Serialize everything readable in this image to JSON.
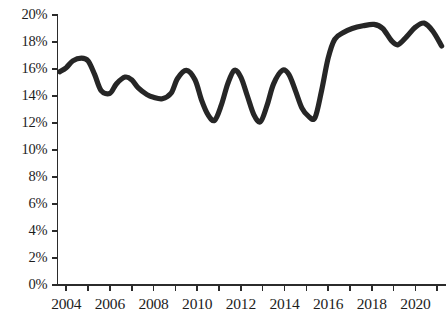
{
  "chart_data": {
    "type": "line",
    "title": "",
    "subtitle": "",
    "xlabel": "",
    "ylabel": "",
    "xlim": [
      2003.6,
      2021.4
    ],
    "ylim": [
      0,
      20
    ],
    "grid": false,
    "legend": false,
    "legend_position": "none",
    "line_color": "#262626",
    "y_tick_labels": [
      "20%",
      "18%",
      "16%",
      "14%",
      "12%",
      "10%",
      "8%",
      "6%",
      "4%",
      "2%",
      "0%"
    ],
    "y_tick_values": [
      20,
      18,
      16,
      14,
      12,
      10,
      8,
      6,
      4,
      2,
      0
    ],
    "y_tick_step": 2,
    "x_tick_labels": [
      "2004",
      "2006",
      "2008",
      "2010",
      "2012",
      "2014",
      "2016",
      "2018",
      "2020"
    ],
    "x_tick_values": [
      2004,
      2006,
      2008,
      2010,
      2012,
      2014,
      2016,
      2018,
      2020
    ],
    "x_minor_tick_values": [
      2004,
      2005,
      2006,
      2007,
      2008,
      2009,
      2010,
      2011,
      2012,
      2013,
      2014,
      2015,
      2016,
      2017,
      2018,
      2019,
      2020,
      2021
    ],
    "series": [
      {
        "name": "series-1",
        "x": [
          2003.7,
          2004.0,
          2004.3,
          2004.7,
          2005.0,
          2005.3,
          2005.6,
          2006.0,
          2006.3,
          2006.7,
          2007.0,
          2007.3,
          2007.7,
          2008.0,
          2008.4,
          2008.8,
          2009.1,
          2009.5,
          2009.9,
          2010.2,
          2010.5,
          2010.8,
          2011.1,
          2011.4,
          2011.7,
          2012.0,
          2012.3,
          2012.6,
          2012.9,
          2013.2,
          2013.5,
          2013.9,
          2014.2,
          2014.5,
          2014.8,
          2015.1,
          2015.4,
          2015.7,
          2016.0,
          2016.3,
          2016.7,
          2017.1,
          2017.6,
          2018.1,
          2018.5,
          2018.9,
          2019.2,
          2019.6,
          2020.0,
          2020.4,
          2020.8,
          2021.2
        ],
        "y": [
          15.8,
          16.1,
          16.6,
          16.8,
          16.6,
          15.6,
          14.4,
          14.2,
          14.9,
          15.4,
          15.2,
          14.6,
          14.1,
          13.9,
          13.8,
          14.2,
          15.3,
          15.9,
          15.2,
          13.7,
          12.6,
          12.2,
          13.3,
          14.9,
          15.9,
          15.4,
          14.0,
          12.6,
          12.1,
          13.3,
          14.9,
          15.9,
          15.6,
          14.4,
          13.1,
          12.5,
          12.4,
          14.4,
          16.8,
          18.2,
          18.7,
          19.0,
          19.2,
          19.3,
          19.0,
          18.1,
          17.8,
          18.4,
          19.1,
          19.4,
          18.8,
          17.7
        ]
      }
    ]
  },
  "axis": {
    "y_axis_name": "percent-axis",
    "x_axis_name": "year-axis"
  }
}
